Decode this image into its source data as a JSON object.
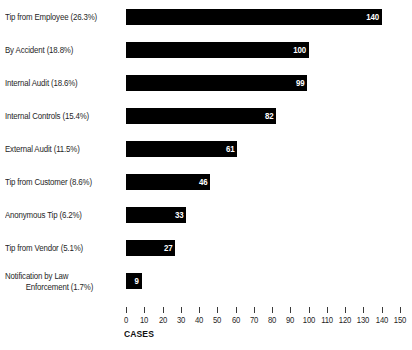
{
  "chart_data": {
    "type": "bar",
    "orientation": "horizontal",
    "title": "",
    "xlabel": "CASES",
    "ylabel": "",
    "xlim": [
      0,
      150
    ],
    "xticks": [
      0,
      10,
      20,
      30,
      40,
      50,
      60,
      70,
      80,
      90,
      100,
      110,
      120,
      130,
      140,
      150
    ],
    "grid": false,
    "legend": null,
    "bar_color": "#000000",
    "value_label_color": "#ffffff",
    "categories": [
      "Tip from Employee (26.3%)",
      "By Accident (18.8%)",
      "Internal Audit (18.6%)",
      "Internal Controls (15.4%)",
      "External Audit (11.5%)",
      "Tip from Customer (8.6%)",
      "Anonymous Tip (6.2%)",
      "Tip from Vendor (5.1%)",
      "Notification by Law Enforcement (1.7%)"
    ],
    "values": [
      140,
      100,
      99,
      82,
      61,
      46,
      33,
      27,
      9
    ],
    "percentages": [
      "26.3%",
      "18.8%",
      "18.6%",
      "15.4%",
      "11.5%",
      "8.6%",
      "6.2%",
      "5.1%",
      "1.7%"
    ]
  },
  "rows": [
    {
      "label": "Tip from Employee (26.3%)",
      "line1": "Tip from Employee (26.3%)",
      "line2": "",
      "value": 140,
      "value_text": "140"
    },
    {
      "label": "By Accident (18.8%)",
      "line1": "By Accident (18.8%)",
      "line2": "",
      "value": 100,
      "value_text": "100"
    },
    {
      "label": "Internal Audit (18.6%)",
      "line1": "Internal Audit (18.6%)",
      "line2": "",
      "value": 99,
      "value_text": "99"
    },
    {
      "label": "Internal Controls (15.4%)",
      "line1": "Internal Controls (15.4%)",
      "line2": "",
      "value": 82,
      "value_text": "82"
    },
    {
      "label": "External Audit (11.5%)",
      "line1": "External Audit (11.5%)",
      "line2": "",
      "value": 61,
      "value_text": "61"
    },
    {
      "label": "Tip from Customer (8.6%)",
      "line1": "Tip from Customer (8.6%)",
      "line2": "",
      "value": 46,
      "value_text": "46"
    },
    {
      "label": "Anonymous Tip (6.2%)",
      "line1": "Anonymous Tip (6.2%)",
      "line2": "",
      "value": 33,
      "value_text": "33"
    },
    {
      "label": "Tip from Vendor (5.1%)",
      "line1": "Tip from Vendor (5.1%)",
      "line2": "",
      "value": 27,
      "value_text": "27"
    },
    {
      "label": "Notification by Law Enforcement (1.7%)",
      "line1": "Notification by Law",
      "line2": "Enforcement (1.7%)",
      "value": 9,
      "value_text": "9"
    }
  ],
  "axis": {
    "title": "CASES",
    "tick_labels": [
      "0",
      "10",
      "20",
      "30",
      "40",
      "50",
      "60",
      "70",
      "80",
      "90",
      "100",
      "110",
      "120",
      "130",
      "140",
      "150"
    ]
  },
  "artifact": {
    "text": " "
  }
}
